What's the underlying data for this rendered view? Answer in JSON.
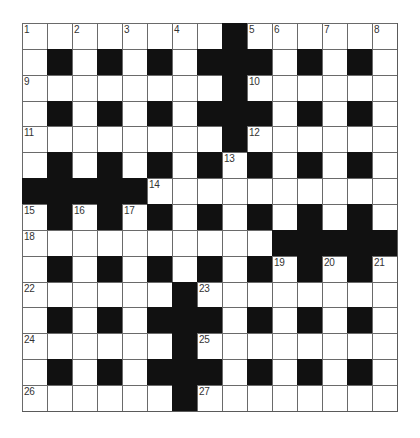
{
  "puzzle": {
    "rows": 15,
    "cols": 15,
    "colors": {
      "block": "#111111",
      "cell": "#ffffff",
      "gridline": "#6a6a6a",
      "number": "#333333"
    },
    "grid": [
      "........#......",
      ".#.#.#.###.#.#.",
      "........#......",
      ".#.#.#.###.#.#.",
      "........#......",
      ".#.#.#.#.#.#.#.",
      "#####..........",
      ".#.#.#.#.#.#.#.",
      "..........#####",
      ".#.#.#.#.#.#.#.",
      "......#........",
      ".#.#.###.#.#.#.",
      "......#........",
      ".#.#.###.#.#.#.",
      "......#........"
    ],
    "numbers": [
      {
        "n": "1",
        "r": 0,
        "c": 0
      },
      {
        "n": "2",
        "r": 0,
        "c": 2
      },
      {
        "n": "3",
        "r": 0,
        "c": 4
      },
      {
        "n": "4",
        "r": 0,
        "c": 6
      },
      {
        "n": "5",
        "r": 0,
        "c": 9
      },
      {
        "n": "6",
        "r": 0,
        "c": 10
      },
      {
        "n": "7",
        "r": 0,
        "c": 12
      },
      {
        "n": "8",
        "r": 0,
        "c": 14
      },
      {
        "n": "9",
        "r": 2,
        "c": 0
      },
      {
        "n": "10",
        "r": 2,
        "c": 9
      },
      {
        "n": "11",
        "r": 4,
        "c": 0
      },
      {
        "n": "12",
        "r": 4,
        "c": 9
      },
      {
        "n": "13",
        "r": 5,
        "c": 8
      },
      {
        "n": "14",
        "r": 6,
        "c": 5
      },
      {
        "n": "15",
        "r": 7,
        "c": 0
      },
      {
        "n": "16",
        "r": 7,
        "c": 2
      },
      {
        "n": "17",
        "r": 7,
        "c": 4
      },
      {
        "n": "18",
        "r": 8,
        "c": 0
      },
      {
        "n": "19",
        "r": 9,
        "c": 10
      },
      {
        "n": "20",
        "r": 9,
        "c": 12
      },
      {
        "n": "21",
        "r": 9,
        "c": 14
      },
      {
        "n": "22",
        "r": 10,
        "c": 0
      },
      {
        "n": "23",
        "r": 10,
        "c": 7
      },
      {
        "n": "24",
        "r": 12,
        "c": 0
      },
      {
        "n": "25",
        "r": 12,
        "c": 7
      },
      {
        "n": "26",
        "r": 14,
        "c": 0
      },
      {
        "n": "27",
        "r": 14,
        "c": 7
      }
    ]
  }
}
